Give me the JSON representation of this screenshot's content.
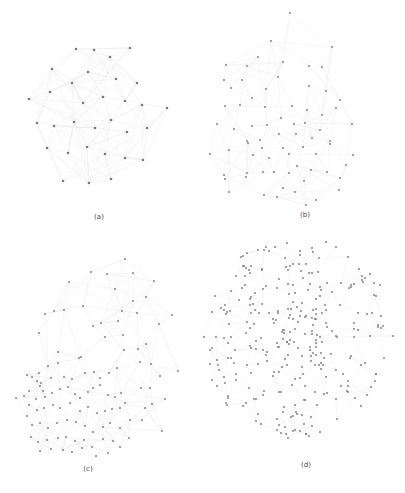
{
  "figure": {
    "background": "#ffffff",
    "node_color": "#7a7a7a",
    "edge_color": "#bdbdbd",
    "panels": [
      {
        "id": "a",
        "caption": "(a)",
        "caption_pos": [
          99,
          218
        ],
        "layout": "dense cluster",
        "edge_opacity": 0.35,
        "edge_density": 4,
        "nodes": [
          [
            76,
            49
          ],
          [
            94,
            50
          ],
          [
            130,
            48
          ],
          [
            110,
            57
          ],
          [
            52,
            69
          ],
          [
            88,
            72
          ],
          [
            116,
            79
          ],
          [
            137,
            83
          ],
          [
            72,
            83
          ],
          [
            50,
            92
          ],
          [
            103,
            97
          ],
          [
            125,
            101
          ],
          [
            142,
            105
          ],
          [
            29,
            99
          ],
          [
            83,
            103
          ],
          [
            167,
            108
          ],
          [
            74,
            122
          ],
          [
            111,
            120
          ],
          [
            37,
            123
          ],
          [
            54,
            126
          ],
          [
            95,
            128
          ],
          [
            127,
            132
          ],
          [
            147,
            128
          ],
          [
            47,
            148
          ],
          [
            87,
            147
          ],
          [
            68,
            153
          ],
          [
            105,
            154
          ],
          [
            125,
            158
          ],
          [
            143,
            160
          ],
          [
            63,
            181
          ],
          [
            89,
            183
          ],
          [
            111,
            179
          ]
        ]
      },
      {
        "id": "b",
        "caption": "(b)",
        "caption_pos": [
          305,
          216
        ],
        "layout": "spread cluster",
        "edge_opacity": 0.25,
        "edge_density": 3,
        "nodes": [
          [
            290,
            13
          ],
          [
            271,
            41
          ],
          [
            332,
            47
          ],
          [
            258,
            57
          ],
          [
            226,
            65
          ],
          [
            247,
            66
          ],
          [
            283,
            62
          ],
          [
            309,
            66
          ],
          [
            322,
            67
          ],
          [
            242,
            80
          ],
          [
            224,
            80
          ],
          [
            278,
            77
          ],
          [
            266,
            89
          ],
          [
            309,
            86
          ],
          [
            326,
            91
          ],
          [
            252,
            98
          ],
          [
            340,
            100
          ],
          [
            231,
            88
          ],
          [
            225,
            106
          ],
          [
            240,
            105
          ],
          [
            265,
            107
          ],
          [
            292,
            106
          ],
          [
            307,
            110
          ],
          [
            322,
            115
          ],
          [
            336,
            108
          ],
          [
            217,
            124
          ],
          [
            234,
            129
          ],
          [
            252,
            126
          ],
          [
            267,
            125
          ],
          [
            281,
            118
          ],
          [
            294,
            124
          ],
          [
            305,
            123
          ],
          [
            320,
            130
          ],
          [
            352,
            124
          ],
          [
            247,
            141
          ],
          [
            260,
            140
          ],
          [
            279,
            134
          ],
          [
            296,
            134
          ],
          [
            312,
            138
          ],
          [
            330,
            144
          ],
          [
            210,
            154
          ],
          [
            229,
            150
          ],
          [
            248,
            143
          ],
          [
            262,
            148
          ],
          [
            283,
            148
          ],
          [
            303,
            147
          ],
          [
            330,
            141
          ],
          [
            353,
            155
          ],
          [
            253,
            155
          ],
          [
            269,
            158
          ],
          [
            289,
            154
          ],
          [
            316,
            154
          ],
          [
            263,
            172
          ],
          [
            289,
            173
          ],
          [
            311,
            170
          ],
          [
            346,
            165
          ],
          [
            224,
            175
          ],
          [
            246,
            177
          ],
          [
            274,
            172
          ],
          [
            297,
            166
          ],
          [
            327,
            172
          ],
          [
            225,
            179
          ],
          [
            283,
            188
          ],
          [
            304,
            181
          ],
          [
            340,
            178
          ],
          [
            247,
            173
          ],
          [
            229,
            192
          ],
          [
            264,
            195
          ],
          [
            295,
            192
          ],
          [
            339,
            190
          ],
          [
            277,
            197
          ],
          [
            316,
            200
          ],
          [
            306,
            205
          ]
        ]
      },
      {
        "id": "c",
        "caption": "(c)",
        "caption_pos": [
          88,
          470
        ],
        "layout": "dense core with sparse periphery",
        "edge_opacity": 0.3,
        "edge_density": 3,
        "nodes": [
          [
            125,
            259
          ],
          [
            91,
            272
          ],
          [
            107,
            274
          ],
          [
            133,
            273
          ],
          [
            69,
            282
          ],
          [
            154,
            281
          ],
          [
            115,
            289
          ],
          [
            146,
            297
          ],
          [
            133,
            301
          ],
          [
            122,
            311
          ],
          [
            45,
            314
          ],
          [
            54,
            311
          ],
          [
            64,
            310
          ],
          [
            83,
            306
          ],
          [
            172,
            315
          ],
          [
            137,
            313
          ],
          [
            93,
            326
          ],
          [
            101,
            323
          ],
          [
            118,
            321
          ],
          [
            39,
            333
          ],
          [
            105,
            337
          ],
          [
            123,
            335
          ],
          [
            159,
            324
          ],
          [
            138,
            349
          ],
          [
            146,
            344
          ],
          [
            124,
            350
          ],
          [
            58,
            352
          ],
          [
            79,
            358
          ],
          [
            81,
            357
          ],
          [
            140,
            362
          ],
          [
            117,
            368
          ],
          [
            151,
            364
          ],
          [
            58,
            363
          ],
          [
            48,
            366
          ],
          [
            39,
            373
          ],
          [
            41,
            383
          ],
          [
            51,
            378
          ],
          [
            64,
            377
          ],
          [
            72,
            379
          ],
          [
            27,
            375
          ],
          [
            32,
            377
          ],
          [
            37,
            381
          ],
          [
            40,
            386
          ],
          [
            43,
            391
          ],
          [
            29,
            391
          ],
          [
            24,
            396
          ],
          [
            36,
            399
          ],
          [
            45,
            397
          ],
          [
            52,
            393
          ],
          [
            60,
            389
          ],
          [
            68,
            387
          ],
          [
            75,
            394
          ],
          [
            80,
            398
          ],
          [
            88,
            392
          ],
          [
            93,
            388
          ],
          [
            100,
            385
          ],
          [
            108,
            395
          ],
          [
            115,
            397
          ],
          [
            121,
            393
          ],
          [
            109,
            373
          ],
          [
            100,
            378
          ],
          [
            94,
            372
          ],
          [
            85,
            373
          ],
          [
            29,
            405
          ],
          [
            37,
            410
          ],
          [
            44,
            408
          ],
          [
            53,
            405
          ],
          [
            60,
            408
          ],
          [
            70,
            403
          ],
          [
            80,
            411
          ],
          [
            88,
            407
          ],
          [
            97,
            413
          ],
          [
            105,
            411
          ],
          [
            112,
            409
          ],
          [
            120,
            408
          ],
          [
            125,
            403
          ],
          [
            141,
            388
          ],
          [
            150,
            388
          ],
          [
            160,
            376
          ],
          [
            165,
            399
          ],
          [
            130,
            420
          ],
          [
            27,
            416
          ],
          [
            32,
            425
          ],
          [
            40,
            423
          ],
          [
            48,
            428
          ],
          [
            57,
            423
          ],
          [
            67,
            420
          ],
          [
            76,
            422
          ],
          [
            85,
            426
          ],
          [
            93,
            432
          ],
          [
            103,
            427
          ],
          [
            110,
            423
          ],
          [
            120,
            428
          ],
          [
            31,
            437
          ],
          [
            38,
            442
          ],
          [
            47,
            440
          ],
          [
            58,
            438
          ],
          [
            66,
            437
          ],
          [
            75,
            441
          ],
          [
            84,
            440
          ],
          [
            92,
            447
          ],
          [
            103,
            439
          ],
          [
            113,
            441
          ],
          [
            120,
            447
          ],
          [
            129,
            438
          ],
          [
            142,
            420
          ],
          [
            162,
            431
          ],
          [
            40,
            451
          ],
          [
            51,
            449
          ],
          [
            63,
            450
          ],
          [
            72,
            452
          ],
          [
            82,
            448
          ],
          [
            96,
            456
          ],
          [
            108,
            453
          ],
          [
            16,
            398
          ],
          [
            145,
            408
          ],
          [
            178,
            371
          ],
          [
            152,
            404
          ]
        ]
      },
      {
        "id": "d",
        "caption": "(d)",
        "caption_pos": [
          306,
          467
        ],
        "layout": "uniform disk",
        "edge_opacity": 0.18,
        "edge_density": 2,
        "nodes": []
      }
    ]
  },
  "captions": {
    "a": "(a)",
    "b": "(b)",
    "c": "(c)",
    "d": "(d)"
  }
}
